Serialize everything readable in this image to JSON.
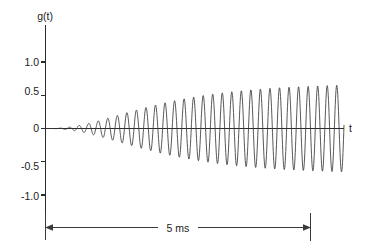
{
  "chart_data": {
    "type": "line",
    "title": "",
    "subtitle": "",
    "xlabel": "t",
    "ylabel": "g(t)",
    "grid": false,
    "legend": null,
    "ylim": [
      -1.35,
      1.35
    ],
    "yticks": [
      1.0,
      0.5,
      0,
      -0.5,
      -1.0
    ],
    "ytick_labels": [
      "1.0",
      "0.5",
      "0",
      "-0.5",
      "-1.0"
    ],
    "xticks": [],
    "xtick_labels": [],
    "xlim_note": "t axis unlabeled; total span annotated as 5 ms",
    "annotations": [
      {
        "name": "span-dimension",
        "text": "5 ms",
        "style": "double-headed-arrow-with-end-caps",
        "from_value": 0,
        "to_value": 5,
        "units": "ms"
      }
    ],
    "series": [
      {
        "name": "g(t)",
        "description": "Exponentially growing sinusoidal oscillation saturating to constant amplitude",
        "envelope_model": "A(t) = A_max * (1 - exp(-(t - t0)/tau))  with slow onset",
        "amplitude_max": 0.68,
        "period_ms": 0.18,
        "onset_time_ms": 0.05,
        "growth_tau_ms": 1.35,
        "cycles_visible": 27,
        "color": "#3a3a3a"
      }
    ]
  },
  "labels": {
    "y_axis_name": "g(t)",
    "x_axis_name": "t",
    "ytick_1": "1.0",
    "ytick_2": "0.5",
    "ytick_3": "0",
    "ytick_4": "-0.5",
    "ytick_5": "-1.0",
    "span_label": "5 ms"
  },
  "colors": {
    "background": "#ffffff",
    "axis": "#2b2b2b",
    "curve": "#3a3a3a",
    "text": "#1a1a1a"
  }
}
